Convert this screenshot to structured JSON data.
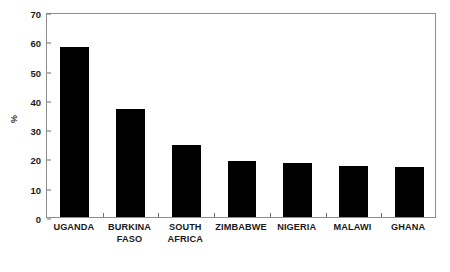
{
  "chart_data": {
    "type": "bar",
    "title": "",
    "subtitle": "",
    "xlabel": "",
    "ylabel": "%",
    "ylim": [
      0,
      70
    ],
    "yticks": [
      0,
      10,
      20,
      30,
      40,
      50,
      60,
      70
    ],
    "ytick_labels": [
      "0",
      "10",
      "20",
      "30",
      "40",
      "50",
      "60",
      "70"
    ],
    "grid": false,
    "legend": false,
    "legend_position": "none",
    "bar_color": "#000000",
    "frame_color": "#8d8d8d",
    "categories": [
      "UGANDA",
      "BURKINA FASO",
      "SOUTH AFRICA",
      "ZIMBABWE",
      "NIGERIA",
      "MALAWI",
      "GHANA"
    ],
    "category_lines": [
      [
        "UGANDA"
      ],
      [
        "BURKINA",
        "FASO"
      ],
      [
        "SOUTH",
        "AFRICA"
      ],
      [
        "ZIMBABWE"
      ],
      [
        "NIGERIA"
      ],
      [
        "MALAWI"
      ],
      [
        "GHANA"
      ]
    ],
    "values": [
      58.2,
      36.9,
      24.5,
      19.0,
      18.5,
      17.4,
      17.2
    ],
    "series": [
      {
        "name": "%",
        "values": [
          58.2,
          36.9,
          24.5,
          19.0,
          18.5,
          17.4,
          17.2
        ]
      }
    ]
  },
  "figure": {
    "axis_label_y": "%",
    "caption_fragment": ""
  }
}
